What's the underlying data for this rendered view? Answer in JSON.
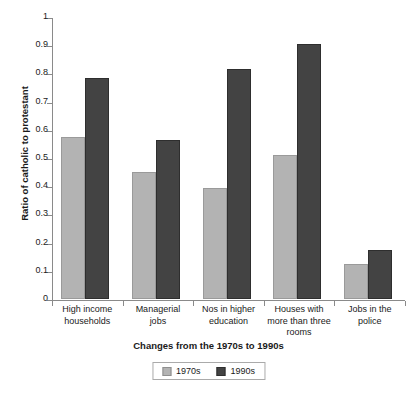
{
  "chart_data": {
    "type": "bar",
    "title": "",
    "subtitle": "",
    "xlabel": "Changes from the 1970s to 1990s",
    "ylabel": "Ratio of catholic to protestant",
    "categories": [
      "High income households",
      "Managerial jobs",
      "Nos in higher education",
      "Houses with more than three rooms",
      "Jobs in the police"
    ],
    "category_lines": [
      [
        "High income",
        "households"
      ],
      [
        "Managerial",
        "jobs"
      ],
      [
        "Nos in higher",
        "education"
      ],
      [
        "Houses with",
        "more than three",
        "rooms"
      ],
      [
        "Jobs in the",
        "police"
      ]
    ],
    "series": [
      {
        "name": "1970s",
        "color": "#b3b3b3",
        "values": [
          0.575,
          0.45,
          0.395,
          0.51,
          0.125
        ]
      },
      {
        "name": "1990s",
        "color": "#434343",
        "values": [
          0.785,
          0.565,
          0.815,
          0.905,
          0.175
        ]
      }
    ],
    "ylim": [
      0,
      1
    ],
    "yticks": [
      0,
      0.1,
      0.2,
      0.3,
      0.4,
      0.5,
      0.6,
      0.7,
      0.8,
      0.9,
      1
    ],
    "ytick_labels": [
      "0",
      "0.1",
      "0.2",
      "0.3",
      "0.4",
      "0.5",
      "0.6",
      "0.7",
      "0.8",
      "0.9",
      "1"
    ],
    "grid": false,
    "legend_position": "bottom",
    "legend_entries": [
      "1970s",
      "1990s"
    ]
  },
  "colors": {
    "series_1970s": "#b3b3b3",
    "series_1990s": "#434343",
    "axis": "#8a8a8a",
    "text": "#1a1a1a",
    "background": "#ffffff"
  }
}
